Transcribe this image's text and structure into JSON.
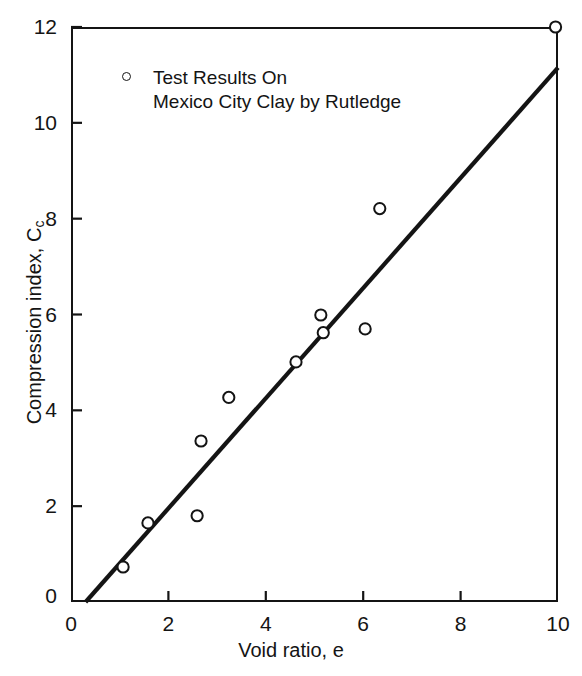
{
  "chart_data": {
    "type": "scatter",
    "title": "",
    "xlabel": "Void ratio, e",
    "ylabel": "Compression index, C",
    "ylabel_sub": "c",
    "xlim": [
      0,
      10
    ],
    "ylim": [
      0,
      12
    ],
    "xticks": [
      0,
      2,
      4,
      6,
      8,
      10
    ],
    "yticks": [
      0,
      2,
      4,
      6,
      8,
      10,
      12
    ],
    "xtick_labels": [
      "0",
      "2",
      "4",
      "6",
      "8",
      "10"
    ],
    "ytick_labels": [
      "0",
      "2",
      "4",
      "6",
      "8",
      "10",
      "12"
    ],
    "grid": false,
    "marker": "open-circle",
    "marker_color": "#141414",
    "line_color": "#141414",
    "legend_position": "top-left-inside",
    "legend": [
      {
        "marker": "open-circle",
        "lines": [
          "Test Results On",
          "Mexico City Clay by Rutledge"
        ]
      }
    ],
    "series": [
      {
        "name": "Test Results On Mexico City Clay by Rutledge",
        "type": "scatter",
        "points": [
          {
            "e": 1.07,
            "Cc": 0.73
          },
          {
            "e": 1.58,
            "Cc": 1.65
          },
          {
            "e": 2.59,
            "Cc": 1.8
          },
          {
            "e": 2.67,
            "Cc": 3.36
          },
          {
            "e": 3.24,
            "Cc": 4.27
          },
          {
            "e": 4.62,
            "Cc": 5.01
          },
          {
            "e": 5.13,
            "Cc": 5.99
          },
          {
            "e": 5.18,
            "Cc": 5.62
          },
          {
            "e": 6.04,
            "Cc": 5.7
          },
          {
            "e": 6.34,
            "Cc": 8.21
          },
          {
            "e": 9.95,
            "Cc": 12.0
          }
        ]
      },
      {
        "name": "Best-fit trend line",
        "type": "line",
        "x": [
          0.3,
          10.0
        ],
        "y": [
          0.0,
          11.15
        ]
      }
    ]
  },
  "figure": {
    "background": "#ffffff",
    "axis_color": "#141414"
  }
}
